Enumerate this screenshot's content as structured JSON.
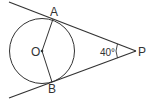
{
  "diagram": {
    "type": "geometry",
    "points": {
      "A": {
        "label": "A"
      },
      "B": {
        "label": "B"
      },
      "O": {
        "label": "O"
      },
      "P": {
        "label": "P"
      }
    },
    "angle_label": "40°",
    "colors": {
      "stroke": "#333333",
      "background": "#ffffff"
    }
  }
}
